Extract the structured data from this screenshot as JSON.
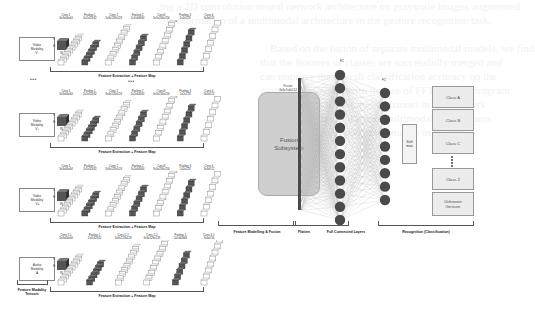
{
  "diagram": {
    "type": "multimodal-gesture-recognition-architecture",
    "background_text_lines": [
      "ing a 3D convolution neural network architecture on grayscale images augmented",
      "by information of a multimodal architecture in the gesture recognition task.",
      "Based on the fusion of separate multimodal models, we find",
      "that the features of classes are successfully merged and",
      "can improve the overall classification accuracy on the",
      "gesture recognition with the use of FFT and spectrogram",
      "based features for the audio channel in our network",
      "combining video and audio multimodal data streams",
      "for a better recognition performance in the task."
    ],
    "modalities": [
      {
        "id": "video-1",
        "box_label": [
          "Video",
          "Modality",
          "V₁"
        ],
        "input_dims": [
          "X",
          "H",
          "W"
        ],
        "layers": [
          {
            "name": "Conv 1",
            "dims": "3x3x64x64"
          },
          {
            "name": "Pooling 1",
            "dims": "2x2x32x32"
          },
          {
            "name": "Conv 2",
            "dims": "3x3x128x128"
          },
          {
            "name": "Pooling 2",
            "dims": "2x2x64x64"
          },
          {
            "name": "Conv3",
            "dims": "3x3x256x256"
          },
          {
            "name": "Pooling 3",
            "dims": "2x2x128"
          },
          {
            "name": "Conv 4",
            "dims": "3x3x512"
          }
        ],
        "bracket_label": "Feature Extraction + Feature Map"
      },
      {
        "id": "video-2",
        "box_label": [
          "Video",
          "Modality",
          "V₂"
        ],
        "input_dims": [
          "X",
          "H",
          "W"
        ],
        "layers": [
          {
            "name": "Conv 1",
            "dims": "3x3x64x64"
          },
          {
            "name": "Pooling 1",
            "dims": "2x2x32x32"
          },
          {
            "name": "Conv 2",
            "dims": "3x3x128x128"
          },
          {
            "name": "Pooling 2",
            "dims": "2x2x64x64"
          },
          {
            "name": "Conv3",
            "dims": "3x3x256x256"
          },
          {
            "name": "Pooling 3",
            "dims": "2x2x128"
          },
          {
            "name": "Conv 4",
            "dims": "3x3x512"
          }
        ],
        "bracket_label": "Feature Extraction + Feature Map"
      },
      {
        "id": "video-n",
        "box_label": [
          "Video",
          "Modality",
          "Vₙ"
        ],
        "input_dims": [
          "X",
          "H",
          "W"
        ],
        "layers": [
          {
            "name": "Conv 1",
            "dims": "3x3x64x64"
          },
          {
            "name": "Pooling 1",
            "dims": "2x2x32x32"
          },
          {
            "name": "Conv 2",
            "dims": "3x3x128x128"
          },
          {
            "name": "Pooling 2",
            "dims": "2x2x64x64"
          },
          {
            "name": "Conv3",
            "dims": "3x3x256x256"
          },
          {
            "name": "Pooling 3",
            "dims": "2x2x128"
          },
          {
            "name": "Conv 4",
            "dims": "3x3x512"
          }
        ],
        "bracket_label": "Feature Extraction + Feature Map"
      },
      {
        "id": "audio",
        "box_label": [
          "Audio",
          "Modality",
          "A"
        ],
        "input_dims": [
          "X",
          "H",
          "W"
        ],
        "layers": [
          {
            "name": "Conv 1-1",
            "dims": "3x3x64x64"
          },
          {
            "name": "Pooling 1",
            "dims": "2x2x32x32"
          },
          {
            "name": "Conv 2-1",
            "dims": "3x3x128x128"
          },
          {
            "name": "Conv 2-2",
            "dims": "3x3x128x128"
          },
          {
            "name": "Pooling 2",
            "dims": "2x2x64x64"
          },
          {
            "name": "Conv 3-1",
            "dims": "3x3x256"
          }
        ],
        "bracket_label": "Feature Extraction + Feature Map"
      }
    ],
    "ellipsis": "•••",
    "modality_tensors_label": [
      "Feature Modality",
      "Tensors"
    ],
    "fusion": {
      "title": "Fusion Subsystem",
      "top_label": [
        "Fusion",
        "3x3x7x4x512"
      ],
      "bracket_label": "Feature Modelling & Fusion"
    },
    "flatten": {
      "label": "Flatten"
    },
    "fc": {
      "layer1_nodes": 12,
      "layer2_nodes": 9,
      "layer1_top_label": "FC",
      "layer2_top_label": "FC",
      "bracket_label": "Full Connected Layers"
    },
    "softmax": {
      "label": [
        "Soft",
        "max"
      ]
    },
    "classes": [
      {
        "label": [
          "Class A"
        ]
      },
      {
        "label": [
          "Class B"
        ]
      },
      {
        "label": [
          "Class C"
        ]
      },
      {
        "label": [
          "Class Z"
        ]
      },
      {
        "label": [
          "Unknown",
          "Gesture"
        ]
      }
    ],
    "recognition": {
      "bracket_label": "Recognition (Classification)"
    },
    "colors": {
      "conv_block": "#ffffff",
      "pool_block": "#555555",
      "fusion_fill": "#cfcfcf",
      "node_fill": "#4a4a4a",
      "class_fill": "#ececec",
      "edge": "#b5b5b5"
    }
  }
}
